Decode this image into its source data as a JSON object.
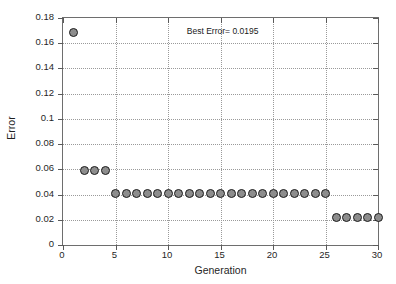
{
  "figure": {
    "background_color": "#ffffff",
    "axis_color": "#6e6e6e",
    "grid_color": "#9a9a9a",
    "marker_fill_color": "#8d8d8d",
    "marker_edge_color": "#1c1c1c"
  },
  "annotation": {
    "text": "Best Error= 0.0195"
  },
  "chart_data": {
    "type": "scatter",
    "title": "",
    "subtitle": "",
    "xlabel": "Generation",
    "ylabel": "Error",
    "xlim": [
      0,
      30
    ],
    "ylim": [
      0,
      0.18
    ],
    "grid": true,
    "legend": null,
    "legend_position": "none",
    "xticks": [
      0,
      5,
      10,
      15,
      20,
      25,
      30
    ],
    "xtick_labels": [
      "0",
      "5",
      "10",
      "15",
      "20",
      "25",
      "30"
    ],
    "yticks": [
      0,
      0.02,
      0.04,
      0.06,
      0.08,
      0.1,
      0.12,
      0.14,
      0.16,
      0.18
    ],
    "ytick_labels": [
      "0",
      "0.02",
      "0.04",
      "0.06",
      "0.08",
      "0.1",
      "0.12",
      "0.14",
      "0.16",
      "0.18"
    ],
    "annotations": [
      {
        "text": "Best Error= 0.0195",
        "x": 15.2,
        "y": 0.1695
      }
    ],
    "series": [
      {
        "name": "Best Error per Generation",
        "marker": "circle",
        "x": [
          1,
          2,
          3,
          4,
          5,
          6,
          7,
          8,
          9,
          10,
          11,
          12,
          13,
          14,
          15,
          16,
          17,
          18,
          19,
          20,
          21,
          22,
          23,
          24,
          25,
          26,
          27,
          28,
          29,
          30
        ],
        "values": [
          0.1685,
          0.0592,
          0.0592,
          0.0592,
          0.0405,
          0.0405,
          0.0405,
          0.0405,
          0.0405,
          0.0405,
          0.0405,
          0.0405,
          0.0405,
          0.0405,
          0.0405,
          0.0405,
          0.0405,
          0.0405,
          0.0405,
          0.0405,
          0.0405,
          0.0405,
          0.0405,
          0.0405,
          0.0405,
          0.0215,
          0.0215,
          0.0215,
          0.0215,
          0.0215
        ]
      }
    ]
  }
}
